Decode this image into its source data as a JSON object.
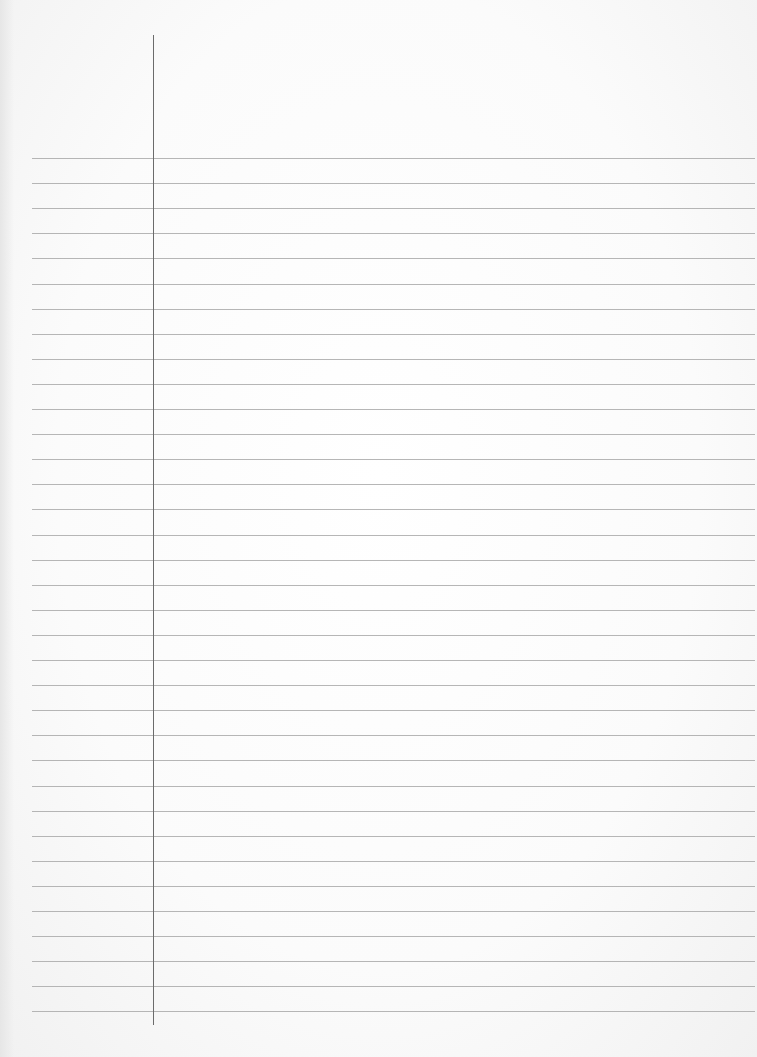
{
  "document": {
    "type": "lined-paper",
    "state": "blank",
    "ruled_lines": {
      "count": 35,
      "first_y": 158,
      "spacing_px": 25.1,
      "left_x": 32,
      "color": "#a9a9a9"
    },
    "margin_line": {
      "x": 153,
      "top_y": 35,
      "bottom_y": 1025,
      "color": "#6b6b6b"
    },
    "paper_color": "#fbfbfb"
  }
}
